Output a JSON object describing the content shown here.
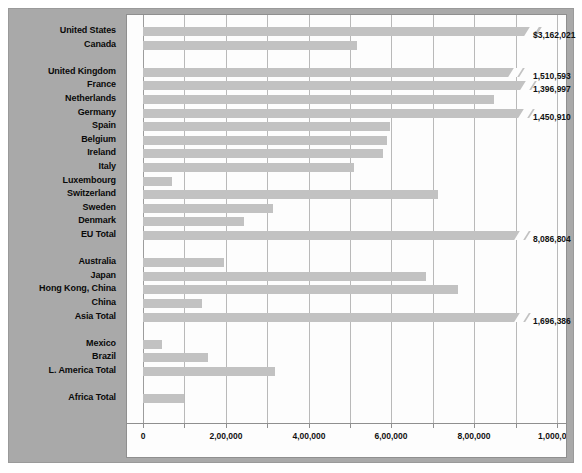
{
  "colors": {
    "panel_bg": "#a9a9a9",
    "plot_bg": "#fdfdfd",
    "bar": "#c2c2c2",
    "gridline": "#b9b9b9",
    "text": "#0a0a0a"
  },
  "chart_data": {
    "type": "bar",
    "orientation": "horizontal",
    "title": "",
    "xlabel": "",
    "ylabel": "",
    "xlim": [
      0,
      1000000
    ],
    "grid": true,
    "legend": "none",
    "xticks": [
      0,
      100000,
      200000,
      300000,
      400000,
      500000,
      600000,
      700000,
      800000,
      900000,
      1000000
    ],
    "xtick_labels": [
      "0",
      "",
      "2,00,000",
      "",
      "4,00,000",
      "",
      "6,00,000",
      "",
      "8,00,000",
      "",
      "1,000,000"
    ],
    "note": "Bars marked truncated are axis-broken; their true value is given in value_label.",
    "categories": [
      "United States",
      "Canada",
      "",
      "United Kingdom",
      "France",
      "Netherlands",
      "Germany",
      "Spain",
      "Belgium",
      "Ireland",
      "Italy",
      "Luxembourg",
      "Switzerland",
      "Sweden",
      "Denmark",
      "EU Total",
      "",
      "Australia",
      "Japan",
      "Hong Kong, China",
      "China",
      "Asia Total",
      "",
      "Mexico",
      "Brazil",
      "L. America Total",
      "",
      "Africa Total"
    ],
    "rows": [
      {
        "label": "United States",
        "plotted": 970000,
        "truncated": true,
        "value_label": "$3,162,021"
      },
      {
        "label": "Canada",
        "plotted": 518000,
        "truncated": false,
        "value_label": ""
      },
      {
        "label": "",
        "plotted": null,
        "truncated": false,
        "value_label": ""
      },
      {
        "label": "United Kingdom",
        "plotted": 930000,
        "truncated": true,
        "value_label": "1,510,593"
      },
      {
        "label": "France",
        "plotted": 960000,
        "truncated": true,
        "value_label": "1,396,997"
      },
      {
        "label": "Netherlands",
        "plotted": 847000,
        "truncated": false,
        "value_label": ""
      },
      {
        "label": "Germany",
        "plotted": 955000,
        "truncated": true,
        "value_label": "1,450,910"
      },
      {
        "label": "Spain",
        "plotted": 597000,
        "truncated": false,
        "value_label": ""
      },
      {
        "label": "Belgium",
        "plotted": 590000,
        "truncated": false,
        "value_label": ""
      },
      {
        "label": "Ireland",
        "plotted": 580000,
        "truncated": false,
        "value_label": ""
      },
      {
        "label": "Italy",
        "plotted": 510000,
        "truncated": false,
        "value_label": ""
      },
      {
        "label": "Luxembourg",
        "plotted": 70000,
        "truncated": false,
        "value_label": ""
      },
      {
        "label": "Switzerland",
        "plotted": 712000,
        "truncated": false,
        "value_label": ""
      },
      {
        "label": "Sweden",
        "plotted": 313000,
        "truncated": false,
        "value_label": ""
      },
      {
        "label": "Denmark",
        "plotted": 243000,
        "truncated": false,
        "value_label": ""
      },
      {
        "label": "EU Total",
        "plotted": 945000,
        "truncated": true,
        "value_label": "8,086,804"
      },
      {
        "label": "",
        "plotted": null,
        "truncated": false,
        "value_label": ""
      },
      {
        "label": "Australia",
        "plotted": 196000,
        "truncated": false,
        "value_label": ""
      },
      {
        "label": "Japan",
        "plotted": 684000,
        "truncated": false,
        "value_label": ""
      },
      {
        "label": "Hong Kong, China",
        "plotted": 760000,
        "truncated": false,
        "value_label": ""
      },
      {
        "label": "China",
        "plotted": 143000,
        "truncated": false,
        "value_label": ""
      },
      {
        "label": "Asia Total",
        "plotted": 945000,
        "truncated": true,
        "value_label": "1,696,386"
      },
      {
        "label": "",
        "plotted": null,
        "truncated": false,
        "value_label": ""
      },
      {
        "label": "Mexico",
        "plotted": 47000,
        "truncated": false,
        "value_label": ""
      },
      {
        "label": "Brazil",
        "plotted": 158000,
        "truncated": false,
        "value_label": ""
      },
      {
        "label": "L. America Total",
        "plotted": 320000,
        "truncated": false,
        "value_label": ""
      },
      {
        "label": "",
        "plotted": null,
        "truncated": false,
        "value_label": ""
      },
      {
        "label": "Africa Total",
        "plotted": 100000,
        "truncated": false,
        "value_label": ""
      }
    ]
  }
}
